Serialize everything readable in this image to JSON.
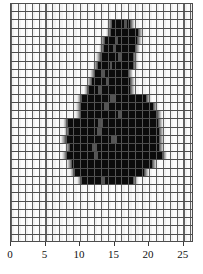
{
  "chart_data": {
    "type": "bar",
    "title": "",
    "subtitle": "",
    "xlabel": "",
    "ylabel": "",
    "xlim": [
      0,
      26.5
    ],
    "grid": true,
    "grid_cell_width": 1,
    "legend": null,
    "orientation": "horizontal",
    "xticks": [
      0,
      5,
      10,
      15,
      20,
      25
    ],
    "xticklabels": [
      "0",
      "5",
      "10",
      "15",
      "20",
      "25"
    ],
    "rows": [
      {
        "index": 1,
        "start": 0.0,
        "end": 0.0,
        "inner_start": 0.0,
        "inner_end": 0.0
      },
      {
        "index": 2,
        "start": 0.0,
        "end": 0.0,
        "inner_start": 0.0,
        "inner_end": 0.0
      },
      {
        "index": 3,
        "start": 14.6,
        "end": 17.2,
        "inner_start": 16.4,
        "inner_end": 16.8
      },
      {
        "index": 4,
        "start": 14.5,
        "end": 18.4,
        "inner_start": 0.0,
        "inner_end": 0.0
      },
      {
        "index": 5,
        "start": 13.6,
        "end": 18.2,
        "inner_start": 15.1,
        "inner_end": 15.5
      },
      {
        "index": 6,
        "start": 13.5,
        "end": 18.0,
        "inner_start": 14.7,
        "inner_end": 15.0
      },
      {
        "index": 7,
        "start": 13.0,
        "end": 17.6,
        "inner_start": 15.5,
        "inner_end": 15.9
      },
      {
        "index": 8,
        "start": 12.6,
        "end": 17.6,
        "inner_start": 14.3,
        "inner_end": 14.7
      },
      {
        "index": 9,
        "start": 12.2,
        "end": 16.9,
        "inner_start": 13.2,
        "inner_end": 13.6
      },
      {
        "index": 10,
        "start": 11.7,
        "end": 17.2,
        "inner_start": 13.7,
        "inner_end": 14.1
      },
      {
        "index": 11,
        "start": 11.3,
        "end": 17.3,
        "inner_start": 12.6,
        "inner_end": 13.0
      },
      {
        "index": 12,
        "start": 10.3,
        "end": 19.6,
        "inner_start": 14.4,
        "inner_end": 15.2
      },
      {
        "index": 13,
        "start": 10.2,
        "end": 20.6,
        "inner_start": 13.4,
        "inner_end": 14.2
      },
      {
        "index": 14,
        "start": 10.1,
        "end": 21.1,
        "inner_start": 15.5,
        "inner_end": 16.1
      },
      {
        "index": 15,
        "start": 8.2,
        "end": 21.3,
        "inner_start": 12.6,
        "inner_end": 13.3
      },
      {
        "index": 16,
        "start": 8.4,
        "end": 21.4,
        "inner_start": 12.4,
        "inner_end": 13.0
      },
      {
        "index": 17,
        "start": 8.0,
        "end": 21.5,
        "inner_start": 14.5,
        "inner_end": 15.3
      },
      {
        "index": 18,
        "start": 8.6,
        "end": 21.4,
        "inner_start": 11.8,
        "inner_end": 12.4
      },
      {
        "index": 19,
        "start": 8.1,
        "end": 21.8,
        "inner_start": 12.0,
        "inner_end": 12.6
      },
      {
        "index": 20,
        "start": 8.8,
        "end": 20.4,
        "inner_start": 0.0,
        "inner_end": 0.0
      },
      {
        "index": 21,
        "start": 9.3,
        "end": 19.2,
        "inner_start": 0.0,
        "inner_end": 0.0
      },
      {
        "index": 22,
        "start": 10.3,
        "end": 17.6,
        "inner_start": 13.0,
        "inner_end": 13.6
      },
      {
        "index": 23,
        "start": 0.0,
        "end": 0.0,
        "inner_start": 0.0,
        "inner_end": 0.0
      },
      {
        "index": 24,
        "start": 0.0,
        "end": 0.0,
        "inner_start": 0.0,
        "inner_end": 0.0
      },
      {
        "index": 25,
        "start": 0.0,
        "end": 0.0,
        "inner_start": 0.0,
        "inner_end": 0.0
      },
      {
        "index": 26,
        "start": 0.0,
        "end": 0.0,
        "inner_start": 0.0,
        "inner_end": 0.0
      },
      {
        "index": 27,
        "start": 0.0,
        "end": 0.0,
        "inner_start": 0.0,
        "inner_end": 0.0
      },
      {
        "index": 28,
        "start": 0.0,
        "end": 0.0,
        "inner_start": 0.0,
        "inner_end": 0.0
      },
      {
        "index": 29,
        "start": 0.0,
        "end": 0.0,
        "inner_start": 0.0,
        "inner_end": 0.0
      }
    ]
  },
  "colors": {
    "bar": "#0b0b0b",
    "grid_line": "#4d4d4d",
    "background": "#ffffff",
    "tick": "#3a3a3a",
    "tick_label": "#111111"
  },
  "caption": {
    "left": "",
    "right": ""
  }
}
